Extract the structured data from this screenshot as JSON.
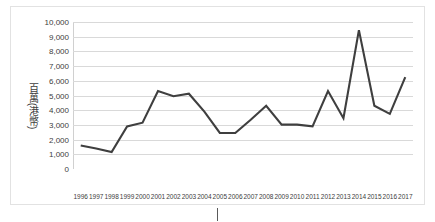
{
  "chart_data": {
    "type": "line",
    "title": "",
    "xlabel": "",
    "ylabel": "百萬(港幣)",
    "categories": [
      "1996",
      "1997",
      "1998",
      "1999",
      "2000",
      "2001",
      "2002",
      "2003",
      "2004",
      "2005",
      "2006",
      "2007",
      "2008",
      "2009",
      "2010",
      "2011",
      "2012",
      "2013",
      "2014",
      "2015",
      "2016",
      "2017"
    ],
    "values": [
      1600,
      1400,
      1150,
      2900,
      3150,
      5300,
      4950,
      5120,
      3900,
      2450,
      2450,
      3350,
      4300,
      3020,
      3020,
      2900,
      5300,
      3450,
      9450,
      4300,
      3750,
      6250
    ],
    "series": [
      {
        "name": "百萬(港幣)",
        "values": [
          1600,
          1400,
          1150,
          2900,
          3150,
          5300,
          4950,
          5120,
          3900,
          2450,
          2450,
          3350,
          4300,
          3020,
          3020,
          2900,
          5300,
          3450,
          9450,
          4300,
          3750,
          6250
        ]
      }
    ],
    "ylim": [
      0,
      10000
    ],
    "ytick_step": 1000,
    "ytick_labels": [
      "0",
      "1,000",
      "2,000",
      "3,000",
      "4,000",
      "5,000",
      "6,000",
      "7,000",
      "8,000",
      "9,000",
      "10,000"
    ],
    "grid": "horizontal",
    "legend": "none",
    "line_color": "#3f3f3f",
    "gridline_color": "#d9d9d9",
    "background_color": "#ffffff"
  }
}
